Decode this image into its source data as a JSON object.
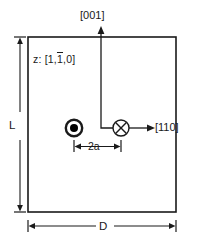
{
  "figure": {
    "labels": {
      "axis_vertical": "[001]",
      "axis_horizontal": "[110]",
      "zone_axis_prefix": "z: [1,",
      "zone_axis_bar": "1",
      "zone_axis_suffix": ",0]",
      "zone_axis_full": "z: [1,1̄,0]",
      "height_dimension": "L",
      "width_dimension": "D",
      "separation_dimension": "2a"
    },
    "symbols": {
      "dislocation_out_of_page": "⊙",
      "dislocation_into_page": "⊗"
    },
    "colors": {
      "line": "#1a1a1a",
      "text": "#1a1a1a",
      "background": "#ffffff",
      "symbol_fill": "#000000"
    },
    "geometry": {
      "rect_left": 28,
      "rect_top": 37,
      "rect_right": 176,
      "rect_bottom": 212,
      "axis_origin_x": 121,
      "axis_origin_y": 128,
      "dot_symbol_x": 74,
      "cross_symbol_x": 121
    }
  }
}
